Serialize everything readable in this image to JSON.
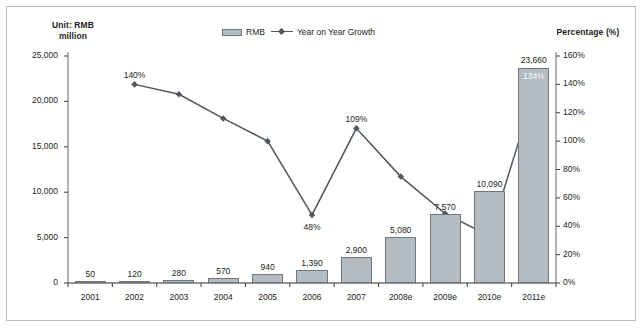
{
  "chart_data": {
    "type": "bar",
    "title": "",
    "subtitle": "",
    "categories": [
      "2001",
      "2002",
      "2003",
      "2004",
      "2005",
      "2006",
      "2007",
      "2008e",
      "2009e",
      "2010e",
      "2011e"
    ],
    "series": [
      {
        "name": "RMB",
        "type": "bar",
        "axis": "left",
        "values": [
          50,
          120,
          280,
          570,
          940,
          1390,
          2900,
          5080,
          7570,
          10090,
          23660
        ],
        "data_labels": [
          "50",
          "120",
          "280",
          "570",
          "940",
          "1,390",
          "2,900",
          "5,080",
          "7,570",
          "10,090",
          "23,660"
        ],
        "color": "#b4bcc2",
        "border_color": "#6f777d"
      },
      {
        "name": "Year on Year Growth",
        "type": "line",
        "axis": "right",
        "values": [
          null,
          140,
          133,
          116,
          100,
          48,
          109,
          75,
          49,
          33,
          134
        ],
        "data_labels": [
          null,
          "140%",
          null,
          null,
          null,
          "48%",
          "109%",
          null,
          null,
          null,
          "134%"
        ],
        "color": "#50565c"
      }
    ],
    "left_axis": {
      "title": "Unit: RMB million",
      "title_lines": [
        "Unit: RMB",
        "million"
      ],
      "ticks": [
        0,
        5000,
        10000,
        15000,
        20000,
        25000
      ],
      "tick_labels": [
        "0",
        "5,000",
        "10,000",
        "15,000",
        "20,000",
        "25,000"
      ],
      "min": 0,
      "max": 25000
    },
    "right_axis": {
      "title": "Percentage (%)",
      "ticks": [
        0,
        20,
        40,
        60,
        80,
        100,
        120,
        140,
        160
      ],
      "tick_labels": [
        "0%",
        "20%",
        "40%",
        "60%",
        "80%",
        "100%",
        "120%",
        "140%",
        "160%"
      ],
      "min": 0,
      "max": 160
    },
    "xlabel": "",
    "grid": false,
    "legend_position": "top-center",
    "legend": [
      "RMB",
      "Year on Year Growth"
    ]
  },
  "legend": {
    "bar_label": "RMB",
    "line_label": "Year on Year Growth"
  }
}
